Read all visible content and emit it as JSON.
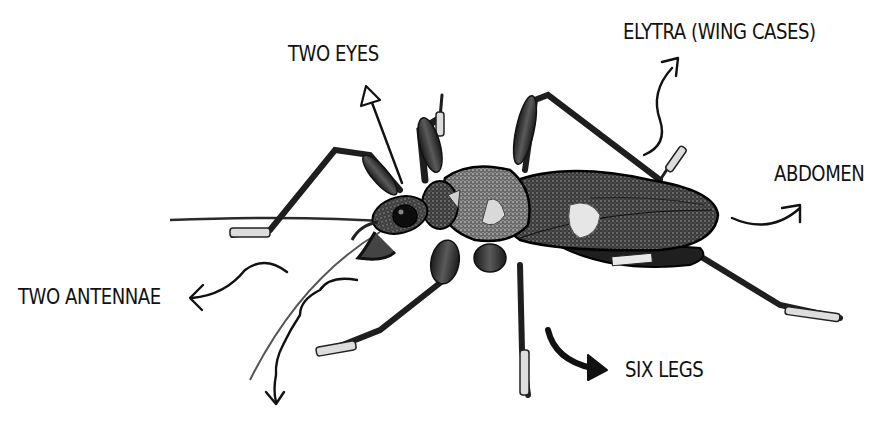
{
  "diagram": {
    "background": "#ffffff",
    "ink_color": "#111111",
    "labels": [
      {
        "id": "eyes",
        "text": "TWO EYES",
        "x": 288,
        "y": 42
      },
      {
        "id": "elytra",
        "text": "ELYTRA (WING CASES)",
        "x": 623,
        "y": 20
      },
      {
        "id": "abdomen",
        "text": "ABDOMEN",
        "x": 774,
        "y": 162
      },
      {
        "id": "antennae",
        "text": "TWO ANTENNAE",
        "x": 18,
        "y": 285
      },
      {
        "id": "legs",
        "text": "SIX LEGS",
        "x": 625,
        "y": 358
      }
    ],
    "arrows": [
      {
        "id": "eyes-arrow",
        "points_to": "eyes",
        "style": "thin straight"
      },
      {
        "id": "elytra-arrow",
        "points_to": "elytra",
        "style": "thin wavy"
      },
      {
        "id": "abdomen-arrow",
        "points_to": "abdomen",
        "style": "thin curved"
      },
      {
        "id": "antennae-arrow",
        "points_to": "antennae",
        "style": "thin wavy"
      },
      {
        "id": "antennae-arrow-2",
        "points_to": "antennae",
        "style": "thin wavy down"
      },
      {
        "id": "legs-arrow",
        "points_to": "legs",
        "style": "thick curved"
      }
    ]
  }
}
